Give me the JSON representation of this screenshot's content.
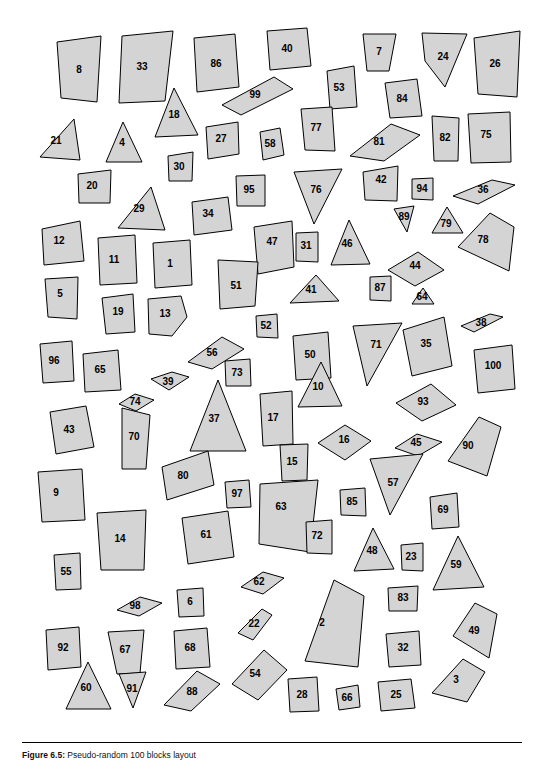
{
  "figure": {
    "caption_bold": "Figure 6.5:",
    "caption_text": "Pseudo-random 100 blocks layout",
    "background": "#ffffff",
    "shape_fill": "#d4d4d4",
    "shape_stroke": "#000000"
  },
  "chart_data": {
    "type": "scatter",
    "title": "Pseudo-random 100 blocks layout",
    "xlabel": "",
    "ylabel": "",
    "grid": false,
    "legend": "none",
    "xlim": [
      0,
      500
    ],
    "ylim": [
      0,
      718
    ],
    "blocks": [
      {
        "label": "8",
        "cx": 57,
        "cy": 56,
        "points": "35,28 79,22 75,88 39,84"
      },
      {
        "label": "33",
        "cx": 120,
        "cy": 53,
        "points": "100,22 151,17 143,87 97,89"
      },
      {
        "label": "86",
        "cx": 194,
        "cy": 50,
        "points": "172,24 213,20 217,73 175,78"
      },
      {
        "label": "40",
        "cx": 265,
        "cy": 35,
        "points": "245,17 285,14 289,52 248,56"
      },
      {
        "label": "7",
        "cx": 357,
        "cy": 38,
        "points": "341,20 374,20 367,57 345,57"
      },
      {
        "label": "24",
        "cx": 421,
        "cy": 43,
        "points": "400,19 445,20 423,73 403,47"
      },
      {
        "label": "26",
        "cx": 473,
        "cy": 50,
        "points": "452,24 498,17 495,83 456,80"
      },
      {
        "label": "99",
        "cx": 233,
        "cy": 81,
        "points": "200,91 252,63 271,75 219,101"
      },
      {
        "label": "53",
        "cx": 317,
        "cy": 74,
        "points": "305,57 332,52 335,93 308,95"
      },
      {
        "label": "84",
        "cx": 380,
        "cy": 85,
        "points": "363,69 395,65 400,102 368,104"
      },
      {
        "label": "18",
        "cx": 152,
        "cy": 101,
        "points": "133,123 152,74 176,121"
      },
      {
        "label": "77",
        "cx": 294,
        "cy": 114,
        "points": "279,95 310,93 313,137 283,136"
      },
      {
        "label": "81",
        "cx": 357,
        "cy": 128,
        "points": "328,142 369,110 398,121 362,147"
      },
      {
        "label": "82",
        "cx": 423,
        "cy": 124,
        "points": "410,102 437,104 436,147 412,147"
      },
      {
        "label": "75",
        "cx": 464,
        "cy": 121,
        "points": "446,100 488,98 489,148 449,149"
      },
      {
        "label": "21",
        "cx": 34,
        "cy": 127,
        "points": "18,143 52,105 58,146"
      },
      {
        "label": "4",
        "cx": 100,
        "cy": 129,
        "points": "84,148 101,108 120,148"
      },
      {
        "label": "27",
        "cx": 199,
        "cy": 125,
        "points": "184,113 216,108 217,140 186,145"
      },
      {
        "label": "58",
        "cx": 248,
        "cy": 130,
        "points": "238,118 258,114 262,141 241,146"
      },
      {
        "label": "30",
        "cx": 157,
        "cy": 153,
        "points": "146,142 171,138 170,167 147,167"
      },
      {
        "label": "20",
        "cx": 70,
        "cy": 172,
        "points": "56,160 89,156 88,189 57,189"
      },
      {
        "label": "95",
        "cx": 227,
        "cy": 176,
        "points": "214,162 243,161 243,192 215,192"
      },
      {
        "label": "76",
        "cx": 294,
        "cy": 176,
        "points": "272,158 320,155 292,210"
      },
      {
        "label": "42",
        "cx": 359,
        "cy": 166,
        "points": "341,158 376,152 375,187 343,186"
      },
      {
        "label": "94",
        "cx": 400,
        "cy": 175,
        "points": "390,165 411,164 411,186 390,185"
      },
      {
        "label": "36",
        "cx": 461,
        "cy": 176,
        "points": "431,182 470,166 493,171 456,190"
      },
      {
        "label": "29",
        "cx": 117,
        "cy": 195,
        "points": "129,173 143,216 96,214"
      },
      {
        "label": "34",
        "cx": 186,
        "cy": 200,
        "points": "170,188 206,183 210,216 172,221"
      },
      {
        "label": "89",
        "cx": 382,
        "cy": 203,
        "points": "372,195 392,192 385,218"
      },
      {
        "label": "79",
        "cx": 424,
        "cy": 210,
        "points": "410,219 425,193 441,219"
      },
      {
        "label": "12",
        "cx": 37,
        "cy": 227,
        "points": "20,215 58,207 62,247 22,251"
      },
      {
        "label": "47",
        "cx": 250,
        "cy": 228,
        "points": "232,213 270,207 272,253 236,260"
      },
      {
        "label": "31",
        "cx": 284,
        "cy": 232,
        "points": "274,219 296,218 296,248 274,247"
      },
      {
        "label": "46",
        "cx": 325,
        "cy": 230,
        "points": "309,251 327,206 348,250"
      },
      {
        "label": "78",
        "cx": 461,
        "cy": 226,
        "points": "436,233 468,199 492,213 487,257"
      },
      {
        "label": "11",
        "cx": 92,
        "cy": 246,
        "points": "76,224 113,221 115,269 78,271"
      },
      {
        "label": "1",
        "cx": 148,
        "cy": 250,
        "points": "131,229 168,226 170,271 133,274"
      },
      {
        "label": "44",
        "cx": 393,
        "cy": 252,
        "points": "366,256 396,238 422,256 393,272"
      },
      {
        "label": "51",
        "cx": 214,
        "cy": 272,
        "points": "196,246 236,248 233,292 198,295"
      },
      {
        "label": "41",
        "cx": 289,
        "cy": 276,
        "points": "268,289 294,261 317,287"
      },
      {
        "label": "87",
        "cx": 358,
        "cy": 274,
        "points": "348,263 369,262 369,287 348,286"
      },
      {
        "label": "5",
        "cx": 38,
        "cy": 280,
        "points": "23,265 56,263 55,305 26,303"
      },
      {
        "label": "64",
        "cx": 400,
        "cy": 283,
        "points": "390,290 401,274 412,290"
      },
      {
        "label": "19",
        "cx": 96,
        "cy": 298,
        "points": "80,284 111,280 113,318 84,320"
      },
      {
        "label": "13",
        "cx": 143,
        "cy": 300,
        "points": "126,285 159,282 165,303 150,322 127,320"
      },
      {
        "label": "52",
        "cx": 244,
        "cy": 312,
        "points": "234,302 255,300 256,324 235,323"
      },
      {
        "label": "38",
        "cx": 459,
        "cy": 309,
        "points": "439,312 468,300 481,303 452,318"
      },
      {
        "label": "71",
        "cx": 354,
        "cy": 331,
        "points": "331,312 380,309 345,372"
      },
      {
        "label": "35",
        "cx": 404,
        "cy": 330,
        "points": "381,316 422,303 430,352 390,362"
      },
      {
        "label": "56",
        "cx": 190,
        "cy": 339,
        "points": "166,348 200,323 222,335 190,355"
      },
      {
        "label": "50",
        "cx": 288,
        "cy": 341,
        "points": "271,322 306,318 309,364 274,366"
      },
      {
        "label": "96",
        "cx": 32,
        "cy": 347,
        "points": "18,330 50,327 52,367 21,369"
      },
      {
        "label": "65",
        "cx": 78,
        "cy": 356,
        "points": "61,340 96,336 99,376 63,378"
      },
      {
        "label": "100",
        "cx": 471,
        "cy": 352,
        "points": "452,336 490,331 493,375 456,379"
      },
      {
        "label": "73",
        "cx": 215,
        "cy": 359,
        "points": "203,347 228,345 229,372 204,372"
      },
      {
        "label": "39",
        "cx": 146,
        "cy": 368,
        "points": "129,365 150,358 167,363 147,376"
      },
      {
        "label": "10",
        "cx": 296,
        "cy": 373,
        "points": "276,393 299,348 320,392"
      },
      {
        "label": "74",
        "cx": 113,
        "cy": 388,
        "points": "97,390 113,380 132,386 114,397"
      },
      {
        "label": "93",
        "cx": 401,
        "cy": 388,
        "points": "374,389 409,370 434,391 400,407"
      },
      {
        "label": "37",
        "cx": 192,
        "cy": 405,
        "points": "168,437 196,366 224,437"
      },
      {
        "label": "17",
        "cx": 251,
        "cy": 404,
        "points": "238,380 270,377 271,430 241,432"
      },
      {
        "label": "43",
        "cx": 47,
        "cy": 416,
        "points": "28,398 64,392 72,433 34,440"
      },
      {
        "label": "70",
        "cx": 112,
        "cy": 423,
        "points": "100,394 128,401 124,455 100,455"
      },
      {
        "label": "16",
        "cx": 322,
        "cy": 426,
        "points": "296,429 323,411 349,427 323,446"
      },
      {
        "label": "45",
        "cx": 394,
        "cy": 429,
        "points": "373,434 395,420 420,428 396,442"
      },
      {
        "label": "90",
        "cx": 446,
        "cy": 432,
        "points": "426,447 457,403 479,413 465,462"
      },
      {
        "label": "15",
        "cx": 270,
        "cy": 448,
        "points": "258,431 286,430 285,466 260,467"
      },
      {
        "label": "80",
        "cx": 161,
        "cy": 462,
        "points": "140,453 186,437 192,471 145,486"
      },
      {
        "label": "57",
        "cx": 371,
        "cy": 469,
        "points": "348,445 401,440 368,501"
      },
      {
        "label": "9",
        "cx": 34,
        "cy": 479,
        "points": "16,458 60,455 63,506 20,508"
      },
      {
        "label": "97",
        "cx": 215,
        "cy": 480,
        "points": "203,468 227,466 229,493 205,494"
      },
      {
        "label": "63",
        "cx": 259,
        "cy": 493,
        "points": "238,470 296,466 288,538 237,530"
      },
      {
        "label": "85",
        "cx": 330,
        "cy": 488,
        "points": "318,476 343,474 344,502 319,501"
      },
      {
        "label": "69",
        "cx": 421,
        "cy": 496,
        "points": "408,483 435,479 437,513 410,515"
      },
      {
        "label": "14",
        "cx": 98,
        "cy": 525,
        "points": "75,499 124,496 122,556 79,556"
      },
      {
        "label": "61",
        "cx": 184,
        "cy": 521,
        "points": "160,504 206,497 212,543 166,550"
      },
      {
        "label": "72",
        "cx": 295,
        "cy": 522,
        "points": "284,508 310,506 310,540 285,539"
      },
      {
        "label": "55",
        "cx": 44,
        "cy": 558,
        "points": "32,541 58,539 59,575 34,576"
      },
      {
        "label": "48",
        "cx": 350,
        "cy": 537,
        "points": "332,557 351,514 372,555"
      },
      {
        "label": "23",
        "cx": 389,
        "cy": 543,
        "points": "379,531 401,529 401,557 380,556"
      },
      {
        "label": "59",
        "cx": 434,
        "cy": 551,
        "points": "411,576 436,522 462,573"
      },
      {
        "label": "62",
        "cx": 237,
        "cy": 568,
        "points": "219,573 241,558 262,564 241,580"
      },
      {
        "label": "98",
        "cx": 113,
        "cy": 592,
        "points": "95,596 118,583 140,589 117,602"
      },
      {
        "label": "6",
        "cx": 168,
        "cy": 588,
        "points": "155,576 181,574 182,602 157,603"
      },
      {
        "label": "83",
        "cx": 381,
        "cy": 584,
        "points": "366,574 396,572 395,597 367,597"
      },
      {
        "label": "2",
        "cx": 300,
        "cy": 609,
        "points": "283,647 312,566 342,582 336,653"
      },
      {
        "label": "22",
        "cx": 232,
        "cy": 610,
        "points": "216,619 240,595 250,601 231,626"
      },
      {
        "label": "49",
        "cx": 452,
        "cy": 617,
        "points": "431,622 453,589 475,600 467,644"
      },
      {
        "label": "92",
        "cx": 41,
        "cy": 634,
        "points": "24,616 57,613 59,653 26,656"
      },
      {
        "label": "67",
        "cx": 103,
        "cy": 636,
        "points": "86,618 122,616 118,659 95,660"
      },
      {
        "label": "68",
        "cx": 168,
        "cy": 634,
        "points": "152,617 185,614 188,653 154,655"
      },
      {
        "label": "32",
        "cx": 381,
        "cy": 634,
        "points": "364,620 397,617 399,651 367,653"
      },
      {
        "label": "54",
        "cx": 233,
        "cy": 660,
        "points": "210,670 242,636 265,656 236,686"
      },
      {
        "label": "3",
        "cx": 434,
        "cy": 666,
        "points": "410,679 441,645 463,658 445,688"
      },
      {
        "label": "60",
        "cx": 64,
        "cy": 674,
        "points": "44,695 66,648 89,695"
      },
      {
        "label": "91",
        "cx": 110,
        "cy": 675,
        "points": "97,660 124,658 111,694"
      },
      {
        "label": "88",
        "cx": 170,
        "cy": 678,
        "points": "142,691 175,657 198,670 169,697"
      },
      {
        "label": "28",
        "cx": 280,
        "cy": 681,
        "points": "266,665 295,663 297,697 268,698"
      },
      {
        "label": "66",
        "cx": 325,
        "cy": 684,
        "points": "314,675 336,671 338,693 317,696"
      },
      {
        "label": "25",
        "cx": 374,
        "cy": 681,
        "points": "356,668 389,665 393,694 359,697"
      }
    ]
  }
}
